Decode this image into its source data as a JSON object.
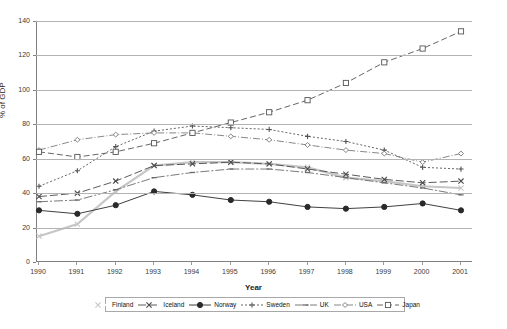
{
  "chart_data": {
    "type": "line",
    "title": "",
    "xlabel": "Year",
    "ylabel": "% of GDP",
    "x": [
      1990,
      1991,
      1992,
      1993,
      1994,
      1995,
      1996,
      1997,
      1998,
      1999,
      2000,
      2001
    ],
    "categories": [
      "1990",
      "1991",
      "1992",
      "1993",
      "1994",
      "1995",
      "1996",
      "1997",
      "1998",
      "1999",
      "2000",
      "2001"
    ],
    "ylim": [
      0,
      140
    ],
    "yticks": [
      0,
      20,
      40,
      60,
      80,
      100,
      120,
      140
    ],
    "grid": true,
    "legend_position": "bottom",
    "series": [
      {
        "name": "Finland",
        "marker": "x",
        "color": "#c6c6c6",
        "dash": "none",
        "values": [
          15,
          22,
          41,
          56,
          58,
          58,
          57,
          55,
          49,
          47,
          44,
          43
        ]
      },
      {
        "name": "Iceland",
        "marker": "x",
        "color": "#4a4a4a",
        "dash": "8,3",
        "values": [
          38,
          40,
          47,
          56,
          57,
          58,
          57,
          54,
          51,
          48,
          46,
          47
        ]
      },
      {
        "name": "Norway",
        "marker": "circle",
        "color": "#2a2a2a",
        "dash": "none",
        "values": [
          30,
          28,
          33,
          41,
          39,
          36,
          35,
          32,
          31,
          32,
          34,
          30
        ]
      },
      {
        "name": "Sweden",
        "marker": "plus",
        "color": "#555555",
        "dash": "2,2",
        "values": [
          44,
          53,
          67,
          76,
          79,
          78,
          77,
          73,
          70,
          65,
          55,
          54
        ]
      },
      {
        "name": "UK",
        "marker": "dash",
        "color": "#6b6b6b",
        "dash": "9,2,2,2",
        "values": [
          35,
          36,
          42,
          49,
          52,
          54,
          54,
          52,
          49,
          46,
          43,
          39
        ]
      },
      {
        "name": "USA",
        "marker": "diamond",
        "color": "#7a7a7a",
        "dash": "7,2,1,2",
        "values": [
          65,
          71,
          74,
          75,
          75,
          73,
          71,
          68,
          65,
          63,
          58,
          63
        ]
      },
      {
        "name": "Japan",
        "marker": "square",
        "color": "#555555",
        "dash": "6,3",
        "values": [
          64,
          61,
          64,
          69,
          75,
          81,
          87,
          94,
          104,
          116,
          124,
          134
        ]
      }
    ]
  },
  "legend": {
    "items": [
      {
        "label": "Finland"
      },
      {
        "label": "Iceland"
      },
      {
        "label": "Norway"
      },
      {
        "label": "Sweden"
      },
      {
        "label": "UK"
      },
      {
        "label": "USA"
      },
      {
        "label": "Japan"
      }
    ]
  }
}
